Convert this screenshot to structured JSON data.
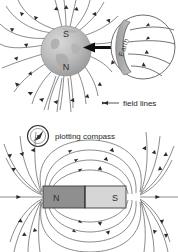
{
  "figure": {
    "background_color": "#ffffff",
    "line_color": "#6e6e6e",
    "arrow_color": "#2b2b2b"
  },
  "panel_earth": {
    "name": "earth-magnetic-field-panel",
    "globe": {
      "north_pole_label": "N",
      "south_pole_label": "S",
      "fill_color": "#b9b9b9"
    },
    "inset": {
      "magnifier_label": "Earth",
      "crescent_color": "#a9a9a9"
    },
    "caption": "field lines"
  },
  "panel_magnet": {
    "name": "bar-magnet-field-panel",
    "compass_label": "plotting compass",
    "magnet": {
      "north_label": "N",
      "south_label": "S",
      "north_color": "#8f8f8f",
      "south_color": "#d6d6d6"
    }
  }
}
